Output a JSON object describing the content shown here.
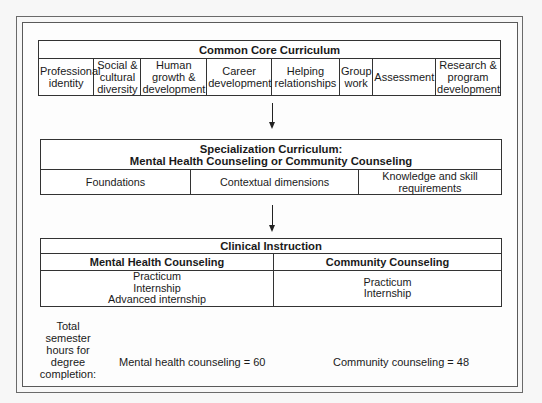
{
  "core": {
    "title": "Common Core Curriculum",
    "cells": [
      {
        "lines": [
          "Professional",
          "identity"
        ]
      },
      {
        "lines": [
          "Social &",
          "cultural",
          "diversity"
        ]
      },
      {
        "lines": [
          "Human",
          "growth &",
          "development"
        ]
      },
      {
        "lines": [
          "Career",
          "development"
        ]
      },
      {
        "lines": [
          "Helping",
          "relationships"
        ]
      },
      {
        "lines": [
          "Group",
          "work"
        ]
      },
      {
        "lines": [
          "Assessment"
        ]
      },
      {
        "lines": [
          "Research &",
          "program",
          "development"
        ]
      }
    ]
  },
  "specialization": {
    "title_line1": "Specialization Curriculum:",
    "title_line2": "Mental Health Counseling or Community Counseling",
    "cells": [
      {
        "lines": [
          "Foundations"
        ]
      },
      {
        "lines": [
          "Contextual dimensions"
        ]
      },
      {
        "lines": [
          "Knowledge and skill",
          "requirements"
        ]
      }
    ]
  },
  "clinical": {
    "title": "Clinical Instruction",
    "columns": [
      {
        "header": "Mental Health Counseling",
        "items": [
          "Practicum",
          "Internship",
          "Advanced internship"
        ]
      },
      {
        "header": "Community Counseling",
        "items": [
          "Practicum",
          "Internship"
        ]
      }
    ]
  },
  "totals": {
    "label_lines": [
      "Total semester",
      "hours for",
      "degree",
      "completion:"
    ],
    "mental_health": "Mental health counseling = 60",
    "community": "Community counseling = 48"
  },
  "icons": {
    "flow_arrow": "arrow-down-icon"
  }
}
